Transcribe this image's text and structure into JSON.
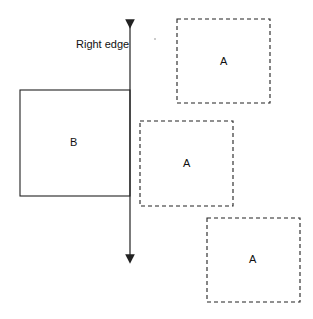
{
  "diagram": {
    "edge_label": "Right edge",
    "box_b": {
      "label": "B",
      "x": 20,
      "y": 90,
      "w": 110,
      "h": 106,
      "style": "solid"
    },
    "boxes_a": [
      {
        "label": "A",
        "x": 177,
        "y": 19,
        "w": 93,
        "h": 84,
        "style": "dashed"
      },
      {
        "label": "A",
        "x": 140,
        "y": 121,
        "w": 93,
        "h": 85,
        "style": "dashed"
      },
      {
        "label": "A",
        "x": 207,
        "y": 218,
        "w": 93,
        "h": 84,
        "style": "dashed"
      }
    ],
    "edge_line": {
      "x": 130,
      "y1": 17,
      "y2": 266
    },
    "stroke_color": "#222222"
  }
}
